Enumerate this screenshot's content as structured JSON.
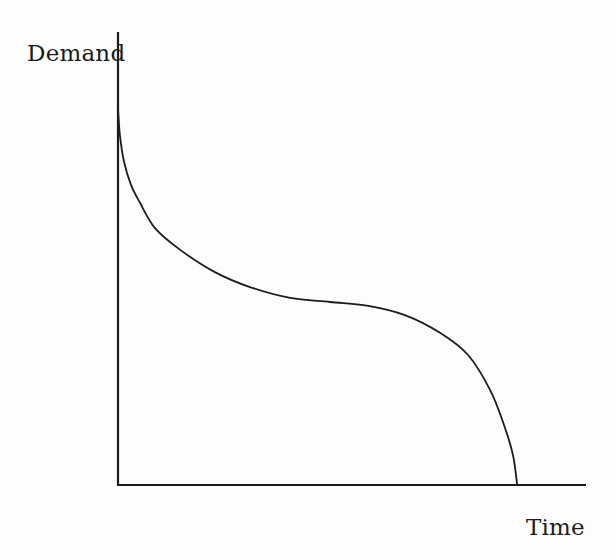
{
  "chart_data": {
    "type": "line",
    "title": "",
    "xlabel": "Time",
    "ylabel": "Demand",
    "xlim": [
      0,
      100
    ],
    "ylim": [
      0,
      100
    ],
    "grid": false,
    "ticks": false,
    "legend": false,
    "axis_color": "#1c1c1c",
    "line_color": "#1c1c1c",
    "background_color": "#fdfdfd",
    "series": [
      {
        "name": "demand-curve",
        "x": [
          0,
          0.4,
          1.3,
          2.8,
          4.7,
          7.9,
          13.3,
          20.7,
          28.2,
          36.8,
          45.3,
          53.8,
          61.3,
          68.8,
          74.8,
          79.5,
          82.5,
          84.4,
          85.3
        ],
        "y": [
          83.2,
          77.3,
          71.3,
          66.2,
          62.3,
          56.7,
          51.9,
          47.0,
          43.7,
          41.3,
          40.4,
          39.5,
          37.5,
          33.6,
          28.7,
          21.0,
          13.2,
          6.6,
          0
        ]
      }
    ]
  }
}
